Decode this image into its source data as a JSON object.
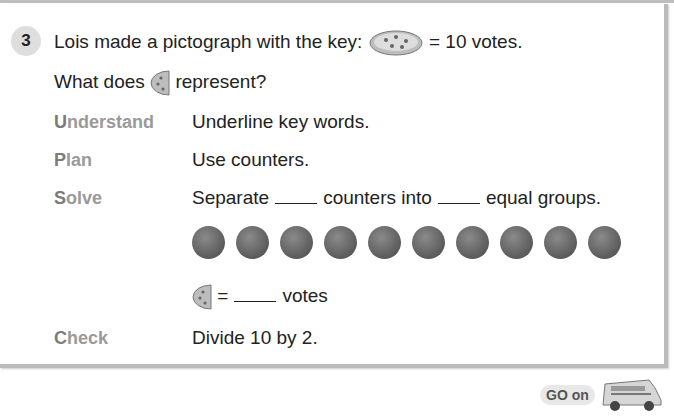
{
  "problem": {
    "number": "3",
    "line1_before": "Lois made a pictograph with the key:",
    "line1_after": "= 10 votes.",
    "line2_before": "What does",
    "line2_after": "represent?"
  },
  "steps": {
    "understand": {
      "label_first": "U",
      "label_rest": "nderstand",
      "text": "Underline key words."
    },
    "plan": {
      "label_first": "P",
      "label_rest": "lan",
      "text": "Use counters."
    },
    "solve": {
      "label_first": "S",
      "label_rest": "olve",
      "text_a": "Separate",
      "text_b": "counters into",
      "text_c": "equal groups."
    },
    "equation": {
      "text_eq": "=",
      "text_votes": "votes"
    },
    "check": {
      "label_first": "C",
      "label_rest": "heck",
      "text": "Divide 10 by 2."
    }
  },
  "counters": {
    "count": 10,
    "color": "#5b5b5b"
  },
  "footer": {
    "go_on": "GO on"
  }
}
